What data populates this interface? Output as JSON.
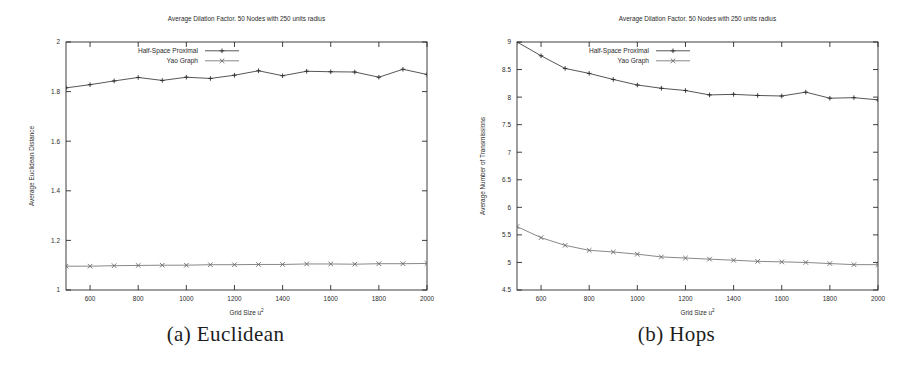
{
  "figure": {
    "background": "#ffffff",
    "ink": "#2b2b2b",
    "panels": [
      {
        "id": "a",
        "caption": "(a) Euclidean",
        "chart_data": {
          "type": "line",
          "title": "Average Dilation Factor. 50 Nodes with 250 units radius",
          "xlabel": "Grid Size u",
          "xlabel_superscript": "2",
          "ylabel": "Average Euclidean Distance",
          "xlim": [
            500,
            2000
          ],
          "ylim": [
            1.0,
            2.0
          ],
          "xticks": [
            600,
            800,
            1000,
            1200,
            1400,
            1600,
            1800,
            2000
          ],
          "yticks": [
            1,
            1.2,
            1.4,
            1.6,
            1.8,
            2
          ],
          "ytick_labels": [
            "1",
            "1.2",
            "1.4",
            "1.6",
            "1.8",
            "2"
          ],
          "grid": false,
          "legend_position": "top-left-inside",
          "x": [
            500,
            600,
            700,
            800,
            900,
            1000,
            1100,
            1200,
            1300,
            1400,
            1500,
            1600,
            1700,
            1800,
            1900,
            2000
          ],
          "series": [
            {
              "name": "Half-Space Proximal",
              "marker": "+",
              "color": "#2b2b2b",
              "values": [
                1.815,
                1.828,
                1.843,
                1.857,
                1.845,
                1.858,
                1.853,
                1.866,
                1.884,
                1.864,
                1.882,
                1.88,
                1.879,
                1.858,
                1.89,
                1.869
              ]
            },
            {
              "name": "Yao Graph",
              "marker": "x",
              "color": "#6a6a6a",
              "values": [
                1.096,
                1.096,
                1.098,
                1.099,
                1.1,
                1.1,
                1.102,
                1.102,
                1.103,
                1.103,
                1.105,
                1.105,
                1.104,
                1.106,
                1.106,
                1.107
              ]
            }
          ]
        }
      },
      {
        "id": "b",
        "caption": "(b) Hops",
        "chart_data": {
          "type": "line",
          "title": "Average Dilation Factor. 50 Nodes with 250 units radius",
          "xlabel": "Grid Size u",
          "xlabel_superscript": "2",
          "ylabel": "Average Number of Transmissions",
          "xlim": [
            500,
            2000
          ],
          "ylim": [
            4.5,
            9.0
          ],
          "xticks": [
            600,
            800,
            1000,
            1200,
            1400,
            1600,
            1800,
            2000
          ],
          "yticks": [
            4.5,
            5,
            5.5,
            6,
            6.5,
            7,
            7.5,
            8,
            8.5,
            9
          ],
          "ytick_labels": [
            "4.5",
            "5",
            "5.5",
            "6",
            "6.5",
            "7",
            "7.5",
            "8",
            "8.5",
            "9"
          ],
          "grid": false,
          "legend_position": "top-left-inside",
          "x": [
            500,
            600,
            700,
            800,
            900,
            1000,
            1100,
            1200,
            1300,
            1400,
            1500,
            1600,
            1700,
            1800,
            1900,
            2000
          ],
          "series": [
            {
              "name": "Half-Space Proximal",
              "marker": "+",
              "color": "#2b2b2b",
              "values": [
                9.0,
                8.75,
                8.52,
                8.43,
                8.32,
                8.22,
                8.16,
                8.12,
                8.04,
                8.05,
                8.03,
                8.02,
                8.09,
                7.98,
                7.99,
                7.95
              ]
            },
            {
              "name": "Yao Graph",
              "marker": "x",
              "color": "#6a6a6a",
              "values": [
                5.65,
                5.45,
                5.31,
                5.22,
                5.19,
                5.15,
                5.1,
                5.08,
                5.06,
                5.04,
                5.02,
                5.01,
                5.0,
                4.98,
                4.96,
                4.96
              ]
            }
          ]
        }
      }
    ]
  }
}
